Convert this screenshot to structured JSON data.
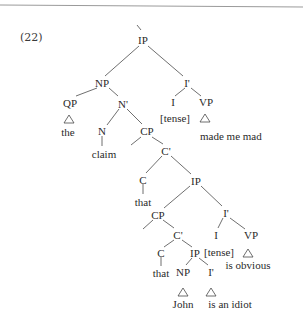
{
  "example_number": "(22)",
  "nodes": {
    "ip_root": "IP",
    "np_subject": "NP",
    "ibar_matrix": "I'",
    "qp": "QP",
    "qp_word": "the",
    "nbar": "N'",
    "n": "N",
    "n_word": "claim",
    "cp_complement": "CP",
    "i_matrix": "I",
    "i_matrix_word": "[tense]",
    "vp_matrix": "VP",
    "vp_matrix_words": "made me mad",
    "cbar_1": "C'",
    "c_1": "C",
    "c_1_word": "that",
    "ip_2": "IP",
    "cp_subject": "CP",
    "ibar_2": "I'",
    "cbar_2": "C'",
    "i_2": "I",
    "i_2_word": "[tense]",
    "vp_2": "VP",
    "vp_2_words": "is obvious",
    "c_2": "C",
    "c_2_word": "that",
    "ip_3": "IP",
    "np_3": "NP",
    "np_3_word": "John",
    "ibar_3": "I'",
    "ibar_3_words": "is an idiot"
  }
}
